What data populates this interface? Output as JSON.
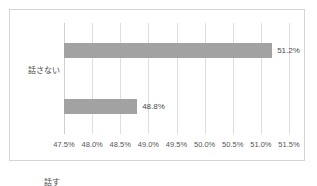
{
  "chart_data": {
    "type": "bar",
    "orientation": "horizontal",
    "title": "",
    "subtitle": "",
    "xlabel": "",
    "ylabel": "",
    "categories": [
      "話さない",
      "話す"
    ],
    "values": [
      51.2,
      48.8
    ],
    "value_labels": [
      "51.2%",
      "48.8%"
    ],
    "xlim": [
      47.5,
      51.5
    ],
    "xticks": [
      47.5,
      48.0,
      48.5,
      49.0,
      49.5,
      50.0,
      50.5,
      51.0,
      51.5
    ],
    "xtick_labels": [
      "47.5%",
      "48.0%",
      "48.5%",
      "49.0%",
      "49.5%",
      "50.0%",
      "50.5%",
      "51.0%",
      "51.5%"
    ],
    "grid": true,
    "grid_axis": "x",
    "legend": false,
    "legend_position": "none",
    "bar_color": "#a2a2a2",
    "gridline_color": "#dedede",
    "frame_color": "#d5d5d5",
    "background_color": "#ffffff",
    "text_color": "#4a4a4a"
  },
  "chart": {
    "bars": [
      {
        "category": "話さない",
        "value": 51.2,
        "label": "51.2%"
      },
      {
        "category": "話す",
        "value": 48.8,
        "label": "48.8%"
      }
    ],
    "ticks": [
      {
        "value": 47.5,
        "label": "47.5%"
      },
      {
        "value": 48.0,
        "label": "48.0%"
      },
      {
        "value": 48.5,
        "label": "48.5%"
      },
      {
        "value": 49.0,
        "label": "49.0%"
      },
      {
        "value": 49.5,
        "label": "49.5%"
      },
      {
        "value": 50.0,
        "label": "50.0%"
      },
      {
        "value": 50.5,
        "label": "50.5%"
      },
      {
        "value": 51.0,
        "label": "51.0%"
      },
      {
        "value": 51.5,
        "label": "51.5%"
      }
    ]
  }
}
